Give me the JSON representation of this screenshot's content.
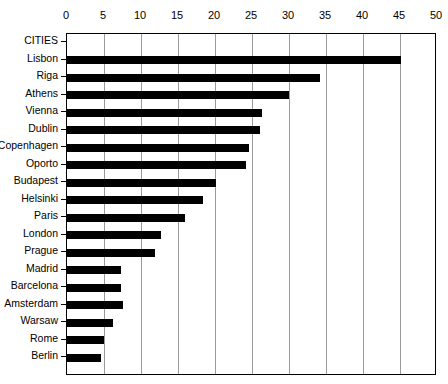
{
  "chart_data": {
    "type": "bar",
    "orientation": "horizontal",
    "title": "",
    "xlabel": "",
    "ylabel": "CITIES",
    "xlim": [
      0,
      50
    ],
    "ylim": null,
    "grid": true,
    "grid_axis": "x",
    "legend": false,
    "x_axis_position": "top",
    "bar_color": "#000000",
    "gridline_color": "#9a9a9a",
    "frame_color": "#000000",
    "background_color": "#ffffff",
    "xticks": [
      0,
      5,
      10,
      15,
      20,
      25,
      30,
      35,
      40,
      45,
      50
    ],
    "xtick_labels": [
      "0",
      "5",
      "10",
      "15",
      "20",
      "25",
      "30",
      "35",
      "40",
      "45",
      "50"
    ],
    "categories": [
      "Lisbon",
      "Riga",
      "Athens",
      "Vienna",
      "Dublin",
      "Copenhagen",
      "Oporto",
      "Budapest",
      "Helsinki",
      "Paris",
      "London",
      "Prague",
      "Madrid",
      "Barcelona",
      "Amsterdam",
      "Warsaw",
      "Rome",
      "Berlin"
    ],
    "values": [
      45.1,
      34.2,
      30.0,
      26.4,
      26.1,
      24.6,
      24.2,
      20.1,
      18.4,
      15.9,
      12.7,
      11.9,
      7.3,
      7.3,
      7.6,
      6.2,
      5.0,
      4.6
    ]
  },
  "axis": {
    "category_axis_title": "CITIES"
  }
}
